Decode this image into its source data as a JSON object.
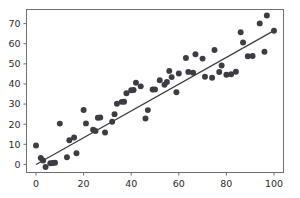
{
  "chart_data": {
    "type": "scatter",
    "title": "",
    "subtitle": "",
    "xlabel": "",
    "ylabel": "",
    "xlim": [
      -4,
      104
    ],
    "ylim": [
      -4,
      77
    ],
    "xticks": [
      0,
      20,
      40,
      60,
      80,
      100
    ],
    "yticks": [
      0,
      10,
      20,
      30,
      40,
      50,
      60,
      70
    ],
    "xticklabels": [
      "0",
      "20",
      "40",
      "60",
      "80",
      "100"
    ],
    "yticklabels": [
      "0",
      "10",
      "20",
      "30",
      "40",
      "50",
      "60",
      "70"
    ],
    "grid": false,
    "legend": null,
    "marker": {
      "shape": "circle",
      "color": "#3c3c44",
      "size": 4.6
    },
    "series": [
      {
        "name": "observations",
        "type": "scatter",
        "points": [
          [
            0,
            9.4
          ],
          [
            2,
            3.2
          ],
          [
            3,
            2.0
          ],
          [
            4,
            -1.3
          ],
          [
            6,
            0.6
          ],
          [
            7,
            0.7
          ],
          [
            8,
            0.8
          ],
          [
            10,
            20.3
          ],
          [
            13,
            3.6
          ],
          [
            14,
            12.0
          ],
          [
            16,
            13.4
          ],
          [
            17,
            5.6
          ],
          [
            20,
            27.1
          ],
          [
            21,
            20.4
          ],
          [
            24,
            17.3
          ],
          [
            25,
            16.6
          ],
          [
            26,
            23.2
          ],
          [
            27,
            23.3
          ],
          [
            29,
            15.9
          ],
          [
            32,
            21.2
          ],
          [
            33,
            25.0
          ],
          [
            34,
            30.2
          ],
          [
            36,
            31.1
          ],
          [
            37,
            31.2
          ],
          [
            38,
            35.4
          ],
          [
            40,
            36.9
          ],
          [
            41,
            37.0
          ],
          [
            42,
            40.6
          ],
          [
            44,
            38.8
          ],
          [
            46,
            22.8
          ],
          [
            47,
            27.0
          ],
          [
            49,
            37.2
          ],
          [
            50,
            37.3
          ],
          [
            52,
            41.8
          ],
          [
            54,
            39.6
          ],
          [
            55,
            41.0
          ],
          [
            56,
            46.5
          ],
          [
            57,
            43.4
          ],
          [
            59,
            35.9
          ],
          [
            60,
            45.2
          ],
          [
            63,
            52.9
          ],
          [
            64,
            46.0
          ],
          [
            66,
            45.6
          ],
          [
            67,
            54.8
          ],
          [
            70,
            52.6
          ],
          [
            71,
            43.6
          ],
          [
            74,
            43.1
          ],
          [
            75,
            56.9
          ],
          [
            77,
            45.9
          ],
          [
            78,
            49.2
          ],
          [
            80,
            44.6
          ],
          [
            82,
            44.8
          ],
          [
            84,
            46.1
          ],
          [
            86,
            65.7
          ],
          [
            87,
            60.6
          ],
          [
            89,
            53.8
          ],
          [
            91,
            53.9
          ],
          [
            94,
            70.1
          ],
          [
            96,
            56.0
          ],
          [
            97,
            74.0
          ],
          [
            100,
            66.4
          ]
        ]
      },
      {
        "name": "fit-line",
        "type": "line",
        "color": "#3c3c44",
        "points": [
          [
            0,
            0.0
          ],
          [
            100,
            66.5
          ]
        ]
      }
    ]
  },
  "axes": {
    "spine_color": "#6f6f78",
    "tick_color": "#6f6f78"
  }
}
